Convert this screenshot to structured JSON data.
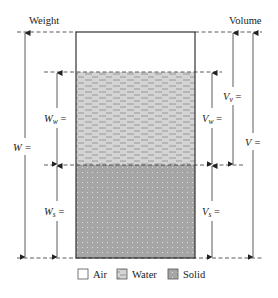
{
  "diagram": {
    "title_left": "Weight",
    "title_right": "Volume",
    "phases": [
      {
        "name": "Air",
        "fraction_of_height": 0.177
      },
      {
        "name": "Water",
        "fraction_of_height": 0.412
      },
      {
        "name": "Solid",
        "fraction_of_height": 0.411
      }
    ],
    "weight_labels": {
      "total": {
        "symbol": "W",
        "suffix": "="
      },
      "water": {
        "symbol": "W",
        "sub": "w",
        "suffix": "="
      },
      "solid": {
        "symbol": "W",
        "sub": "s",
        "suffix": "="
      }
    },
    "volume_labels": {
      "total": {
        "symbol": "V",
        "suffix": "="
      },
      "voids": {
        "symbol": "V",
        "sub": "v",
        "suffix": "="
      },
      "water": {
        "symbol": "V",
        "sub": "w",
        "suffix": "="
      },
      "solid": {
        "symbol": "V",
        "sub": "s",
        "suffix": "="
      }
    },
    "legend": [
      {
        "label": "Air",
        "icon": "air-swatch-icon"
      },
      {
        "label": "Water",
        "icon": "water-swatch-icon"
      },
      {
        "label": "Solid",
        "icon": "solid-swatch-icon"
      }
    ],
    "colors": {
      "air": "#ffffff",
      "water": "#d4d4d4",
      "water_dash": "#8a8a8a",
      "solid": "#a6a6a6",
      "solid_dot": "#e6e6e6",
      "outline": "#333333"
    }
  }
}
